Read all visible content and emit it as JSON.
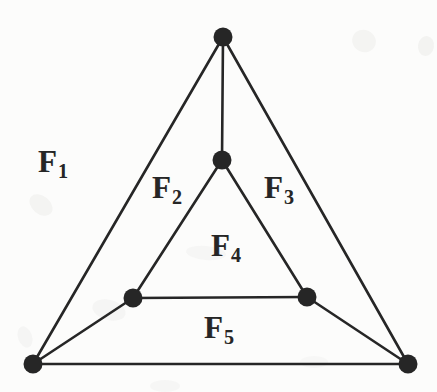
{
  "figure": {
    "background_color": "#fcfcfb",
    "ink_color": "#262626",
    "stroke_width": 2.6,
    "vertex_radius": 9.5,
    "vertices": [
      {
        "id": "v-top",
        "name": "top-vertex",
        "x": 223,
        "y": 37
      },
      {
        "id": "v-inner-top",
        "name": "inner-top-vertex",
        "x": 222,
        "y": 160
      },
      {
        "id": "v-inner-left",
        "name": "inner-left-vertex",
        "x": 133,
        "y": 298
      },
      {
        "id": "v-inner-right",
        "name": "inner-right-vertex",
        "x": 307,
        "y": 297
      },
      {
        "id": "v-bottom-left",
        "name": "bottom-left-vertex",
        "x": 33,
        "y": 364
      },
      {
        "id": "v-bottom-right",
        "name": "bottom-right-vertex",
        "x": 408,
        "y": 364
      }
    ],
    "edges": [
      {
        "name": "edge-top-to-bottom-left",
        "from": "v-top",
        "to": "v-bottom-left"
      },
      {
        "name": "edge-top-to-bottom-right",
        "from": "v-top",
        "to": "v-bottom-right"
      },
      {
        "name": "edge-top-to-inner-top",
        "from": "v-top",
        "to": "v-inner-top"
      },
      {
        "name": "edge-inner-top-to-inner-left",
        "from": "v-inner-top",
        "to": "v-inner-left"
      },
      {
        "name": "edge-inner-top-to-inner-right",
        "from": "v-inner-top",
        "to": "v-inner-right"
      },
      {
        "name": "edge-inner-left-to-inner-right",
        "from": "v-inner-left",
        "to": "v-inner-right"
      },
      {
        "name": "edge-inner-left-to-bottom-left",
        "from": "v-inner-left",
        "to": "v-bottom-left"
      },
      {
        "name": "edge-inner-right-to-bottom-right",
        "from": "v-inner-right",
        "to": "v-bottom-right"
      },
      {
        "name": "edge-bottom-left-to-bottom-right",
        "from": "v-bottom-left",
        "to": "v-bottom-right"
      }
    ],
    "labels": [
      {
        "id": "F1",
        "letter": "F",
        "subscript": "1",
        "x": 38,
        "y": 146
      },
      {
        "id": "F2",
        "letter": "F",
        "subscript": "2",
        "x": 152,
        "y": 172
      },
      {
        "id": "F3",
        "letter": "F",
        "subscript": "3",
        "x": 264,
        "y": 172
      },
      {
        "id": "F4",
        "letter": "F",
        "subscript": "4",
        "x": 211,
        "y": 230
      },
      {
        "id": "F5",
        "letter": "F",
        "subscript": "5",
        "x": 204,
        "y": 312
      }
    ],
    "smudges": [
      {
        "x": 28,
        "y": 196,
        "w": 26,
        "h": 18,
        "r": 40,
        "o": 0.07
      },
      {
        "x": 92,
        "y": 300,
        "w": 34,
        "h": 20,
        "r": 15,
        "o": 0.06
      },
      {
        "x": 14,
        "y": 330,
        "w": 22,
        "h": 14,
        "r": 70,
        "o": 0.06
      },
      {
        "x": 352,
        "y": 30,
        "w": 24,
        "h": 22,
        "r": 25,
        "o": 0.07
      },
      {
        "x": 418,
        "y": 36,
        "w": 16,
        "h": 20,
        "r": 10,
        "o": 0.08
      },
      {
        "x": 186,
        "y": 246,
        "w": 40,
        "h": 14,
        "r": 5,
        "o": 0.05
      },
      {
        "x": 150,
        "y": 380,
        "w": 30,
        "h": 12,
        "r": 0,
        "o": 0.05
      },
      {
        "x": 300,
        "y": 356,
        "w": 28,
        "h": 12,
        "r": 0,
        "o": 0.04
      }
    ]
  }
}
